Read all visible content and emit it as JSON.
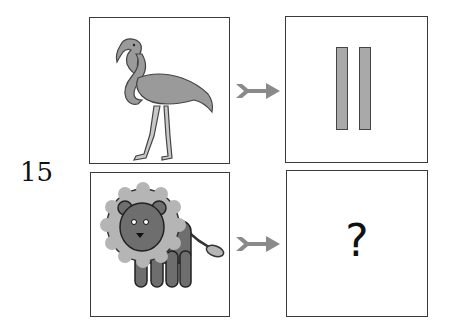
{
  "puzzle": {
    "number": "15",
    "rows": [
      {
        "input": {
          "image": "flamingo",
          "icon": "flamingo-icon"
        },
        "arrow": "right-arrow-icon",
        "output": {
          "type": "bars",
          "count": 2
        }
      },
      {
        "input": {
          "image": "lion",
          "icon": "lion-icon"
        },
        "arrow": "right-arrow-icon",
        "output": {
          "type": "unknown",
          "text": "?"
        }
      }
    ],
    "colors": {
      "border": "#3a3a3a",
      "fill_gray": "#a9a9a9",
      "arrow": "#8a8a8a",
      "lion_body": "#6e6e6e",
      "lion_mane": "#b5b5b5"
    }
  }
}
